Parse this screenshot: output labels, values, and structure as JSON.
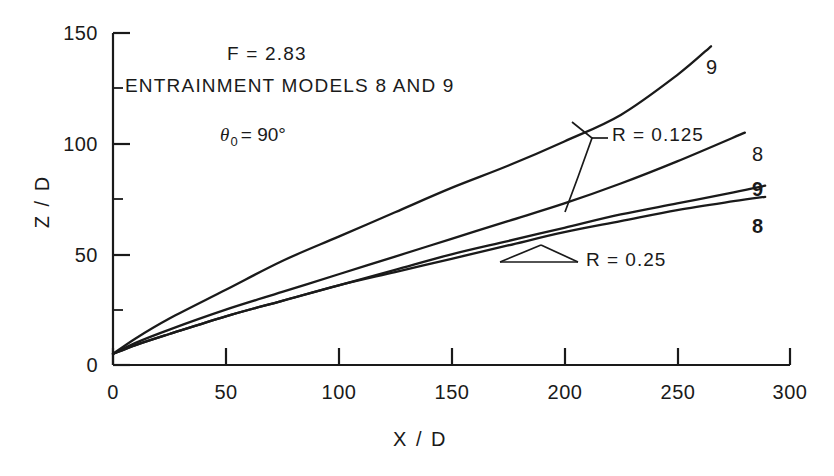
{
  "chart_data": {
    "type": "line",
    "title": "",
    "xlabel": "X / D",
    "ylabel": "Z / D",
    "xlim": [
      0,
      300
    ],
    "ylim": [
      0,
      150
    ],
    "xticks": [
      0,
      50,
      100,
      150,
      200,
      250,
      300
    ],
    "yticks": [
      0,
      50,
      100,
      150
    ],
    "xminor_step": 25,
    "yminor_step": 25,
    "grid": false,
    "legend": "none",
    "line_color": "#1a1a1a",
    "series": [
      {
        "name": "R = 0.125, model 9",
        "label": "9",
        "R": 0.125,
        "model": 9,
        "x": [
          0,
          10,
          25,
          50,
          75,
          100,
          125,
          150,
          175,
          200,
          225,
          250,
          265
        ],
        "y": [
          5,
          12,
          21,
          34,
          47,
          58,
          69,
          80,
          90,
          101,
          113,
          131,
          144
        ]
      },
      {
        "name": "R = 0.125, model 8",
        "label": "8",
        "R": 0.125,
        "model": 8,
        "x": [
          0,
          10,
          25,
          50,
          75,
          100,
          125,
          150,
          175,
          200,
          225,
          250,
          280
        ],
        "y": [
          5,
          10,
          16,
          25,
          33,
          41,
          49,
          57,
          65,
          73,
          82,
          92,
          105
        ]
      },
      {
        "name": "R = 0.25, model 9",
        "label": "9",
        "R": 0.25,
        "model": 9,
        "x": [
          0,
          10,
          25,
          50,
          75,
          100,
          125,
          150,
          175,
          200,
          225,
          250,
          275,
          289
        ],
        "y": [
          5,
          9,
          14,
          22,
          29,
          36,
          43,
          50,
          56,
          62,
          68,
          73,
          78,
          81
        ]
      },
      {
        "name": "R = 0.25, model 8",
        "label": "8",
        "R": 0.25,
        "model": 8,
        "x": [
          0,
          10,
          25,
          50,
          75,
          100,
          125,
          150,
          175,
          200,
          225,
          250,
          275,
          289
        ],
        "y": [
          5,
          9,
          14,
          22,
          29,
          36,
          42,
          48,
          54,
          60,
          65,
          70,
          74,
          76
        ]
      }
    ],
    "annotations": [
      {
        "id": "froude",
        "text": "F = 2.83"
      },
      {
        "id": "models",
        "text": "ENTRAINMENT MODELS 8 AND 9"
      },
      {
        "id": "angle_symbol",
        "text": "θ"
      },
      {
        "id": "angle_subscript",
        "text": "0"
      },
      {
        "id": "angle_value",
        "text": "= 90°"
      },
      {
        "id": "ratio_high",
        "text": "R = 0.125"
      },
      {
        "id": "ratio_low",
        "text": "R = 0.25"
      }
    ],
    "curve_tags": [
      {
        "id": "tag-9-upper",
        "text": "9",
        "bold": false
      },
      {
        "id": "tag-8-upper",
        "text": "8",
        "bold": false
      },
      {
        "id": "tag-9-lower",
        "text": "9",
        "bold": true
      },
      {
        "id": "tag-8-lower",
        "text": "8",
        "bold": true
      }
    ]
  },
  "axes": {
    "x_tick_labels": [
      "0",
      "50",
      "100",
      "150",
      "200",
      "250",
      "300"
    ],
    "y_tick_labels": [
      "0",
      "50",
      "100",
      "150"
    ],
    "x_title": "X / D",
    "y_title": "Z / D"
  }
}
